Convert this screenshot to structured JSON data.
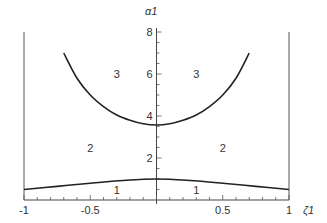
{
  "chart_data": {
    "type": "line",
    "title": "",
    "xlabel": "ζ1",
    "ylabel": "α1",
    "xlim": [
      -1,
      1
    ],
    "ylim": [
      0,
      8.4
    ],
    "grid": false,
    "x_ticks": [
      -1,
      -0.5,
      0.5,
      1
    ],
    "x_tick_labels": [
      "-1",
      "-0.5",
      "0.5",
      "1"
    ],
    "y_ticks": [
      2,
      4,
      6,
      8
    ],
    "y_tick_labels": [
      "2",
      "4",
      "6",
      "8"
    ],
    "series": [
      {
        "name": "upper boundary (regions 2/3)",
        "x": [
          -0.7,
          -0.6,
          -0.5,
          -0.4,
          -0.3,
          -0.2,
          -0.1,
          0,
          0.1,
          0.2,
          0.3,
          0.4,
          0.5,
          0.6,
          0.7
        ],
        "y": [
          7.0,
          5.8,
          5.0,
          4.45,
          4.05,
          3.8,
          3.63,
          3.57,
          3.63,
          3.8,
          4.05,
          4.45,
          5.0,
          5.8,
          7.0
        ]
      },
      {
        "name": "lower boundary (regions 1/2)",
        "x": [
          -1,
          -0.75,
          -0.5,
          -0.25,
          0,
          0.25,
          0.5,
          0.75,
          1
        ],
        "y": [
          0.5,
          0.65,
          0.8,
          0.93,
          1.0,
          0.93,
          0.8,
          0.65,
          0.5
        ]
      }
    ],
    "annotations": [
      {
        "text": "3",
        "x": -0.3,
        "y": 6.0
      },
      {
        "text": "3",
        "x": 0.3,
        "y": 6.0
      },
      {
        "text": "2",
        "x": -0.5,
        "y": 2.5
      },
      {
        "text": "2",
        "x": 0.5,
        "y": 2.5
      },
      {
        "text": "1",
        "x": -0.3,
        "y": 0.5
      },
      {
        "text": "1",
        "x": 0.3,
        "y": 0.5
      }
    ]
  }
}
